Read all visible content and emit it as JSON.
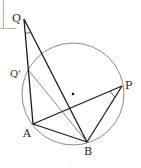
{
  "diagram": {
    "type": "geometry",
    "colors": {
      "bold_line": "#1a1a1a",
      "thin_line": "#777777",
      "circle": "#888888",
      "text": "#222222",
      "frame": "#999999"
    },
    "circle": {
      "cx": 73,
      "cy": 94,
      "r": 51
    },
    "center_dot": {
      "x": 73,
      "y": 94
    },
    "points": {
      "Q": {
        "label": "Q",
        "x": 24,
        "y": 19
      },
      "Qp": {
        "label": "Q'",
        "x": 29,
        "y": 71
      },
      "P": {
        "label": "P",
        "x": 122,
        "y": 86
      },
      "A": {
        "label": "A",
        "x": 33,
        "y": 124
      },
      "B": {
        "label": "B",
        "x": 87,
        "y": 142
      }
    },
    "labels": {
      "Q": "Q",
      "Qp": "Q'",
      "P": "P",
      "A": "A",
      "B": "B"
    },
    "segments": [
      {
        "from": "Q",
        "to": "A",
        "style": "bold"
      },
      {
        "from": "Q",
        "to": "B",
        "style": "bold"
      },
      {
        "from": "A",
        "to": "B",
        "style": "bold"
      },
      {
        "from": "A",
        "to": "P",
        "style": "bold"
      },
      {
        "from": "P",
        "to": "B",
        "style": "bold"
      },
      {
        "from": "Qp",
        "to": "B",
        "style": "thin"
      }
    ],
    "angle_marks": [
      {
        "vertex": "Q",
        "between": [
          "A",
          "B"
        ]
      },
      {
        "vertex": "P",
        "between": [
          "A",
          "B"
        ]
      }
    ]
  }
}
